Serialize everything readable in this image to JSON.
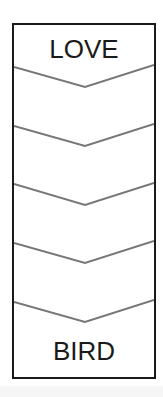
{
  "puzzle": {
    "start_word": "LOVE",
    "end_word": "BIRD",
    "blank_rungs": 4,
    "chevron_count": 5
  },
  "colors": {
    "border": "#1a1a1a",
    "chevron": "#777777",
    "text": "#1a1a1a"
  }
}
